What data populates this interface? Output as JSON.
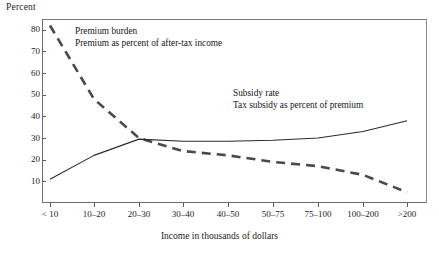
{
  "chart_data": {
    "type": "line",
    "title": "",
    "ylabel": "Percent",
    "xlabel": "Income in thousands of dollars",
    "categories": [
      "< 10",
      "10–20",
      "20–30",
      "30–40",
      "40–50",
      "50–75",
      "75–100",
      "100–200",
      ">200"
    ],
    "yticks": [
      10,
      20,
      30,
      40,
      50,
      60,
      70,
      80
    ],
    "ylim": [
      0,
      85
    ],
    "grid": false,
    "legend_position": "inline-annotations",
    "series": [
      {
        "name": "Premium burden",
        "description": "Premium as percent of after-tax income",
        "style": "dashed",
        "color": "#4a4a4a",
        "values": [
          82,
          48,
          30,
          24,
          22,
          19,
          17,
          13,
          5
        ]
      },
      {
        "name": "Subsidy rate",
        "description": "Tax subsidy as percent of premium",
        "style": "solid",
        "color": "#2b2b2b",
        "values": [
          11,
          22,
          29.5,
          28.5,
          28.5,
          29,
          30,
          33,
          38
        ]
      }
    ],
    "annotations": [
      {
        "id": "premium",
        "line1": "Premium burden",
        "line2": "Premium as percent of after-tax income"
      },
      {
        "id": "subsidy",
        "line1": "Subsidy rate",
        "line2": "Tax subsidy as percent of premium"
      }
    ]
  }
}
